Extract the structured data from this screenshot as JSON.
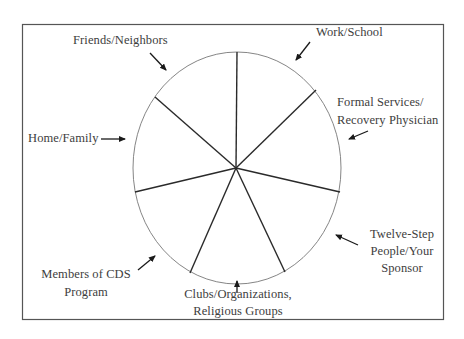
{
  "diagram": {
    "type": "support-network-wheel",
    "segments": 7,
    "colors": {
      "border": "#555555",
      "circle": "#777777",
      "spoke": "#2a2a2a",
      "arrow": "#1a1a1a",
      "text": "#3d3d3d"
    },
    "labels": [
      {
        "id": "friends",
        "lines": [
          "Friends/Neighbors"
        ]
      },
      {
        "id": "work",
        "lines": [
          "Work/School"
        ]
      },
      {
        "id": "formal",
        "lines": [
          "Formal Services/",
          "Recovery Physician"
        ]
      },
      {
        "id": "home",
        "lines": [
          "Home/Family"
        ]
      },
      {
        "id": "twelve",
        "lines": [
          "Twelve-Step",
          "People/Your",
          "Sponsor"
        ]
      },
      {
        "id": "cds",
        "lines": [
          "Members of CDS",
          "Program"
        ]
      },
      {
        "id": "clubs",
        "lines": [
          "Clubs/Organizations,",
          "Religious Groups"
        ]
      }
    ]
  }
}
